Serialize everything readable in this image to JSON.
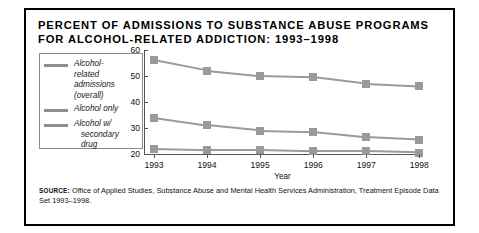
{
  "title": {
    "line1": "PERCENT OF ADMISSIONS TO SUBSTANCE ABUSE PROGRAMS",
    "line2": "FOR ALCOHOL-RELATED ADDICTION: 1993–1998"
  },
  "source": {
    "label": "SOURCE:",
    "text": " Office of Applied Studies, Substance Abuse and Mental Health Services Administration, Treatment Episode Data Set  1993–1998."
  },
  "legend": [
    {
      "lines": [
        "Alcohol-",
        "related",
        "admissions",
        "(overall)"
      ],
      "color": "#8f8f8f"
    },
    {
      "lines": [
        "Alcohol only"
      ],
      "color": "#8f8f8f"
    },
    {
      "lines": [
        "Alcohol w/",
        "secondary",
        "drug"
      ],
      "color": "#8f8f8f"
    }
  ],
  "chart_data": {
    "type": "line",
    "title": "PERCENT OF ADMISSIONS TO SUBSTANCE ABUSE PROGRAMS FOR ALCOHOL-RELATED ADDICTION: 1993–1998",
    "xlabel": "Year",
    "ylabel": "",
    "categories": [
      "1993",
      "1994",
      "1995",
      "1996",
      "1997",
      "1998"
    ],
    "ylim": [
      20,
      60
    ],
    "yticks": [
      20,
      30,
      40,
      50,
      60
    ],
    "grid": false,
    "legend_position": "left-outside",
    "series": [
      {
        "name": "Alcohol-related admissions (overall)",
        "color": "#9a9a9a",
        "values": [
          56,
          52,
          50,
          49.5,
          47,
          46
        ]
      },
      {
        "name": "Alcohol only",
        "color": "#9a9a9a",
        "values": [
          34,
          31,
          29,
          28.5,
          26.5,
          25.5
        ]
      },
      {
        "name": "Alcohol w/ secondary drug",
        "color": "#9a9a9a",
        "values": [
          22,
          21.5,
          21.5,
          21,
          21,
          20.5
        ]
      }
    ]
  }
}
